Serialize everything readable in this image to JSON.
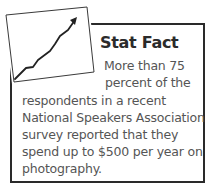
{
  "callout": {
    "title": "Stat Fact",
    "icon": "rising-line-chart-icon",
    "border_color": "#2a2a2a",
    "text_color": "#555555",
    "title_color": "#2b2b2b",
    "body_lines": [
      "More than 75",
      "percent of the",
      "respondents in a recent",
      "National Speakers Association",
      "survey reported that they",
      "spend up to $500 per year on",
      "photography."
    ]
  }
}
